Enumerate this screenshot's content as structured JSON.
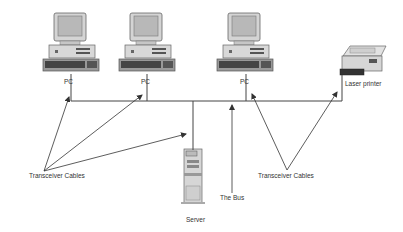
{
  "diagram": {
    "nodes": [
      {
        "id": "pc1",
        "type": "pc",
        "label": "PC"
      },
      {
        "id": "pc2",
        "type": "pc",
        "label": "PC"
      },
      {
        "id": "pc3",
        "type": "pc",
        "label": "PC"
      },
      {
        "id": "printer",
        "type": "laser-printer",
        "label": "Laser printer"
      },
      {
        "id": "server",
        "type": "server",
        "label": "Server"
      }
    ],
    "annotations": {
      "left_cables": "Transceiver Cables",
      "right_cables": "Transceiver Cables",
      "bus": "The Bus"
    },
    "colors": {
      "line": "#444444",
      "device_body": "#d8d8d8",
      "device_dark": "#555555",
      "screen": "#bdbdbd"
    }
  }
}
